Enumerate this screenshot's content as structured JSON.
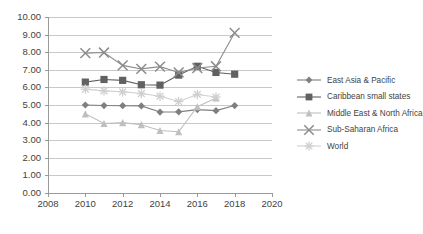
{
  "chart_data": {
    "type": "line",
    "title": "",
    "xlabel": "",
    "ylabel": "",
    "x": [
      2010,
      2011,
      2012,
      2013,
      2014,
      2015,
      2016,
      2017,
      2018
    ],
    "xlim": [
      2008,
      2020
    ],
    "ylim": [
      0.0,
      10.0
    ],
    "xticks": [
      "2008",
      "2010",
      "2012",
      "2014",
      "2016",
      "2018",
      "2020"
    ],
    "xtick_values": [
      2008,
      2010,
      2012,
      2014,
      2016,
      2018,
      2020
    ],
    "yticks": [
      "0.00",
      "1.00",
      "2.00",
      "3.00",
      "4.00",
      "5.00",
      "6.00",
      "7.00",
      "8.00",
      "9.00",
      "10.00"
    ],
    "ytick_values": [
      0,
      1,
      2,
      3,
      4,
      5,
      6,
      7,
      8,
      9,
      10
    ],
    "grid": "horizontal",
    "legend_position": "right",
    "series": [
      {
        "name": "East Asia & Pacific",
        "marker": "diamond",
        "color": "#7f7f7f",
        "x": [
          2010,
          2011,
          2012,
          2013,
          2014,
          2015,
          2016,
          2017,
          2018
        ],
        "values": [
          5.0,
          4.97,
          4.96,
          4.95,
          4.6,
          4.61,
          4.74,
          4.68,
          4.97
        ]
      },
      {
        "name": "Caribbean small states",
        "marker": "square",
        "color": "#616161",
        "x": [
          2010,
          2011,
          2012,
          2013,
          2014,
          2015,
          2016,
          2017,
          2018
        ],
        "values": [
          6.3,
          6.45,
          6.4,
          6.15,
          6.13,
          6.7,
          7.2,
          6.85,
          6.75
        ]
      },
      {
        "name": "Middle East & North Africa",
        "marker": "triangle",
        "color": "#bfbfbf",
        "x": [
          2010,
          2011,
          2012,
          2013,
          2014,
          2015,
          2016,
          2017
        ],
        "values": [
          4.5,
          3.95,
          4.0,
          3.88,
          3.55,
          3.48,
          4.9,
          5.4
        ]
      },
      {
        "name": "Sub-Saharan Africa",
        "marker": "x",
        "color": "#8c8c8c",
        "x": [
          2010,
          2011,
          2012,
          2013,
          2014,
          2015,
          2016,
          2017,
          2018
        ],
        "values": [
          7.95,
          7.98,
          7.25,
          7.05,
          7.18,
          6.85,
          7.1,
          7.2,
          9.1
        ]
      },
      {
        "name": "World",
        "marker": "asterisk",
        "color": "#cfcfcf",
        "x": [
          2010,
          2011,
          2012,
          2013,
          2014,
          2015,
          2016,
          2017
        ],
        "values": [
          5.9,
          5.8,
          5.75,
          5.65,
          5.5,
          5.2,
          5.6,
          5.45
        ]
      }
    ]
  },
  "legend": {
    "items": [
      {
        "label": "East Asia & Pacific"
      },
      {
        "label": "Caribbean small states"
      },
      {
        "label": "Middle East & North Africa"
      },
      {
        "label": "Sub-Saharan Africa"
      },
      {
        "label": "World"
      }
    ]
  },
  "colors": {
    "grid": "#c9c9c9",
    "axis": "#9a9a9a",
    "text": "#3f3f3f",
    "background": "#ffffff"
  }
}
